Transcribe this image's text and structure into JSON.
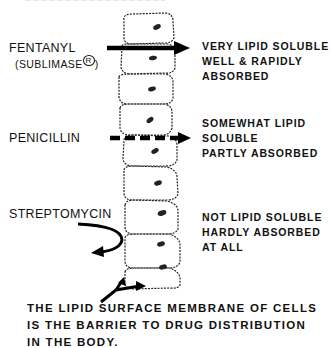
{
  "drugs": [
    {
      "name": "FENTANYL",
      "subname": "(SUBLIMASE",
      "trademark": "R",
      "subname_close": ")",
      "arrow_style": "solid",
      "description": [
        "VERY LIPID SOLUBLE",
        "WELL & RAPIDLY",
        "ABSORBED"
      ]
    },
    {
      "name": "PENICILLIN",
      "arrow_style": "dashed",
      "description": [
        "SOMEWHAT LIPID",
        "SOLUBLE",
        "PARTLY ABSORBED"
      ]
    },
    {
      "name": "STREPTOMYCIN",
      "arrow_style": "deflected",
      "description": [
        "NOT LIPID SOLUBLE",
        "HARDLY ABSORBED",
        "AT ALL"
      ]
    }
  ],
  "caption": [
    "THE LIPID SURFACE MEMBRANE OF CELLS",
    "IS THE BARRIER TO DRUG DISTRIBUTION",
    "IN THE BODY."
  ],
  "cell_count": 10,
  "colors": {
    "ink": "#111111",
    "background": "#ffffff"
  }
}
